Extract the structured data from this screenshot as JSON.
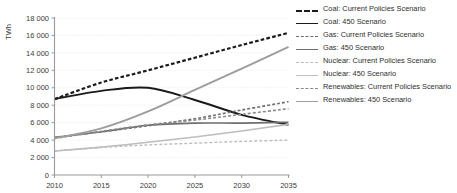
{
  "chart_data": {
    "type": "line",
    "title": "",
    "xlabel": "",
    "ylabel": "TWh",
    "xlim": [
      2010,
      2035
    ],
    "ylim": [
      0,
      18000
    ],
    "xticks": [
      "2010",
      "2015",
      "2020",
      "2025",
      "2030",
      "2035"
    ],
    "yticks": [
      "0",
      "2 000",
      "4 000",
      "6 000",
      "8 000",
      "10 000",
      "12 000",
      "14 000",
      "16 000",
      "18 000"
    ],
    "grid": "horizontal-dotted",
    "legend_position": "right",
    "x": [
      2010,
      2015,
      2020,
      2025,
      2030,
      2035
    ],
    "series": [
      {
        "name": "Coal: Current Policies Scenario",
        "color": "#1a1a1a",
        "style": "dashed",
        "width": 2.2,
        "values": [
          8700,
          10600,
          12000,
          13450,
          14900,
          16300
        ]
      },
      {
        "name": "Coal: 450 Scenario",
        "color": "#1a1a1a",
        "style": "solid",
        "width": 1.9,
        "values": [
          8700,
          9650,
          10000,
          8600,
          6900,
          5750
        ]
      },
      {
        "name": "Gas: Current Policies Scenario",
        "color": "#6e6e6e",
        "style": "dashed",
        "width": 1.6,
        "values": [
          4300,
          4950,
          5650,
          6450,
          7450,
          8400
        ]
      },
      {
        "name": "Gas: 450 Scenario",
        "color": "#6e6e6e",
        "style": "solid",
        "width": 1.6,
        "values": [
          4300,
          4950,
          5700,
          5950,
          5950,
          6050
        ]
      },
      {
        "name": "Nuclear: Current Policies Scenario",
        "color": "#bdbdbd",
        "style": "dashed",
        "width": 1.4,
        "values": [
          2750,
          3150,
          3450,
          3650,
          3850,
          4000
        ]
      },
      {
        "name": "Nuclear: 450 Scenario",
        "color": "#bdbdbd",
        "style": "solid",
        "width": 1.6,
        "values": [
          2750,
          3200,
          3750,
          4350,
          5050,
          5800
        ]
      },
      {
        "name": "Renewables: Current Policies Scenario",
        "color": "#8a8a8a",
        "style": "dashed",
        "width": 1.6,
        "values": [
          4200,
          5000,
          5750,
          6300,
          6950,
          7600
        ]
      },
      {
        "name": "Renewables: 450 Scenario",
        "color": "#9d9d9d",
        "style": "solid",
        "width": 1.9,
        "values": [
          4200,
          5350,
          7300,
          9750,
          12200,
          14700
        ]
      }
    ]
  },
  "legend": {
    "items": [
      {
        "label": "Coal: Current Policies Scenario"
      },
      {
        "label": "Coal: 450 Scenario"
      },
      {
        "label": "Gas: Current Policies Scenario"
      },
      {
        "label": "Gas: 450 Scenario"
      },
      {
        "label": "Nuclear: Current Policies Scenario"
      },
      {
        "label": "Nuclear: 450 Scenario"
      },
      {
        "label": "Renewables: Current Policies Scenario"
      },
      {
        "label": "Renewables: 450 Scenario"
      }
    ]
  }
}
